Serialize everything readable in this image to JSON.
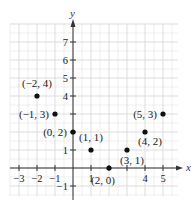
{
  "chart_data": {
    "type": "scatter",
    "title": "",
    "xlabel": "x",
    "ylabel": "y",
    "xlim": [
      -3.5,
      5.8
    ],
    "ylim": [
      -1.5,
      8
    ],
    "grid": true,
    "x_ticks": [
      "-3",
      "-2",
      "-1",
      "1",
      "4",
      "5"
    ],
    "y_ticks": [
      "-1",
      "1",
      "4",
      "5",
      "6",
      "7"
    ],
    "points": [
      {
        "x": -2,
        "y": 4,
        "label": "(−2, 4)"
      },
      {
        "x": -1,
        "y": 3,
        "label": "(−1, 3)"
      },
      {
        "x": 0,
        "y": 2,
        "label": "(0, 2)"
      },
      {
        "x": 1,
        "y": 1,
        "label": "(1, 1)"
      },
      {
        "x": 2,
        "y": 0,
        "label": "(2, 0)"
      },
      {
        "x": 3,
        "y": 1,
        "label": "(3, 1)"
      },
      {
        "x": 4,
        "y": 2,
        "label": "(4, 2)"
      },
      {
        "x": 5,
        "y": 3,
        "label": "(5, 3)"
      }
    ]
  },
  "colors": {
    "grid": "#d4d4d4",
    "axis": "#333333",
    "point": "#111111"
  }
}
